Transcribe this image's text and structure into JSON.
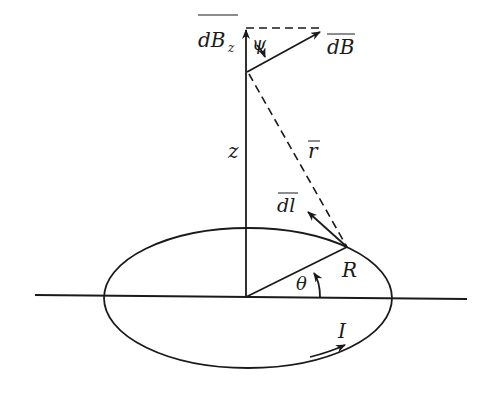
{
  "diagram": {
    "labels": {
      "dBz": "dB",
      "dBz_sub": "z",
      "dB": "dB",
      "psi": "ψ",
      "z": "z",
      "r": "r",
      "dl": "dl",
      "R": "R",
      "theta": "θ",
      "I": "I"
    },
    "colors": {
      "line": "#1a1a1a",
      "background": "#ffffff"
    },
    "geometry": {
      "loop_center": [
        248,
        298
      ],
      "loop_rx": 144,
      "loop_ry": 70,
      "axis_top": [
        246,
        28
      ],
      "field_point": [
        247,
        72
      ],
      "loop_point": [
        347,
        247
      ],
      "dB_tip": [
        322,
        30
      ],
      "dl_tip": [
        306,
        210
      ]
    }
  }
}
